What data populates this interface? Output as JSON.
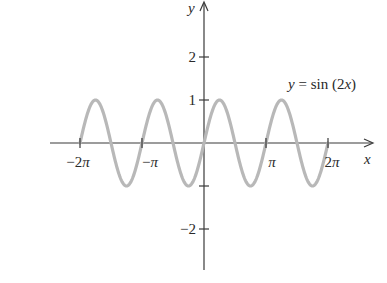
{
  "chart_data": {
    "type": "line",
    "title": "",
    "function_label": "y = sin (2x)",
    "function_label_parts": {
      "y": "y",
      "eq": " = sin (2",
      "x": "x",
      "close": ")"
    },
    "xlabel": "x",
    "ylabel": "y",
    "x_range": [
      -6.2832,
      6.2832
    ],
    "xlim": [
      -7.8,
      8.5
    ],
    "ylim": [
      -3.0,
      3.3
    ],
    "x_ticks": [
      {
        "value": -6.2832,
        "label": "−2π"
      },
      {
        "value": -3.1416,
        "label": "−π"
      },
      {
        "value": 3.1416,
        "label": "π"
      },
      {
        "value": 6.2832,
        "label": "2π"
      }
    ],
    "y_ticks": [
      {
        "value": 2,
        "label": "2"
      },
      {
        "value": 1,
        "label": "1"
      },
      {
        "value": -1,
        "label": ""
      },
      {
        "value": -2,
        "label": "−2"
      }
    ],
    "series": [
      {
        "name": "y = sin(2x)",
        "color": "#b8b8b8",
        "x": [
          -6.2832,
          -5.4978,
          -4.7124,
          -3.927,
          -3.1416,
          -2.3562,
          -1.5708,
          -0.7854,
          0,
          0.7854,
          1.5708,
          2.3562,
          3.1416,
          3.927,
          4.7124,
          5.4978,
          6.2832
        ],
        "values": [
          0,
          1,
          0,
          -1,
          0,
          1,
          0,
          -1,
          0,
          1,
          0,
          -1,
          0,
          1,
          0,
          -1,
          0
        ]
      }
    ],
    "grid": false,
    "legend": "none"
  },
  "colors": {
    "axis": "#3a3a3a",
    "curve": "#b8b8b8",
    "text": "#2a2a2a"
  }
}
